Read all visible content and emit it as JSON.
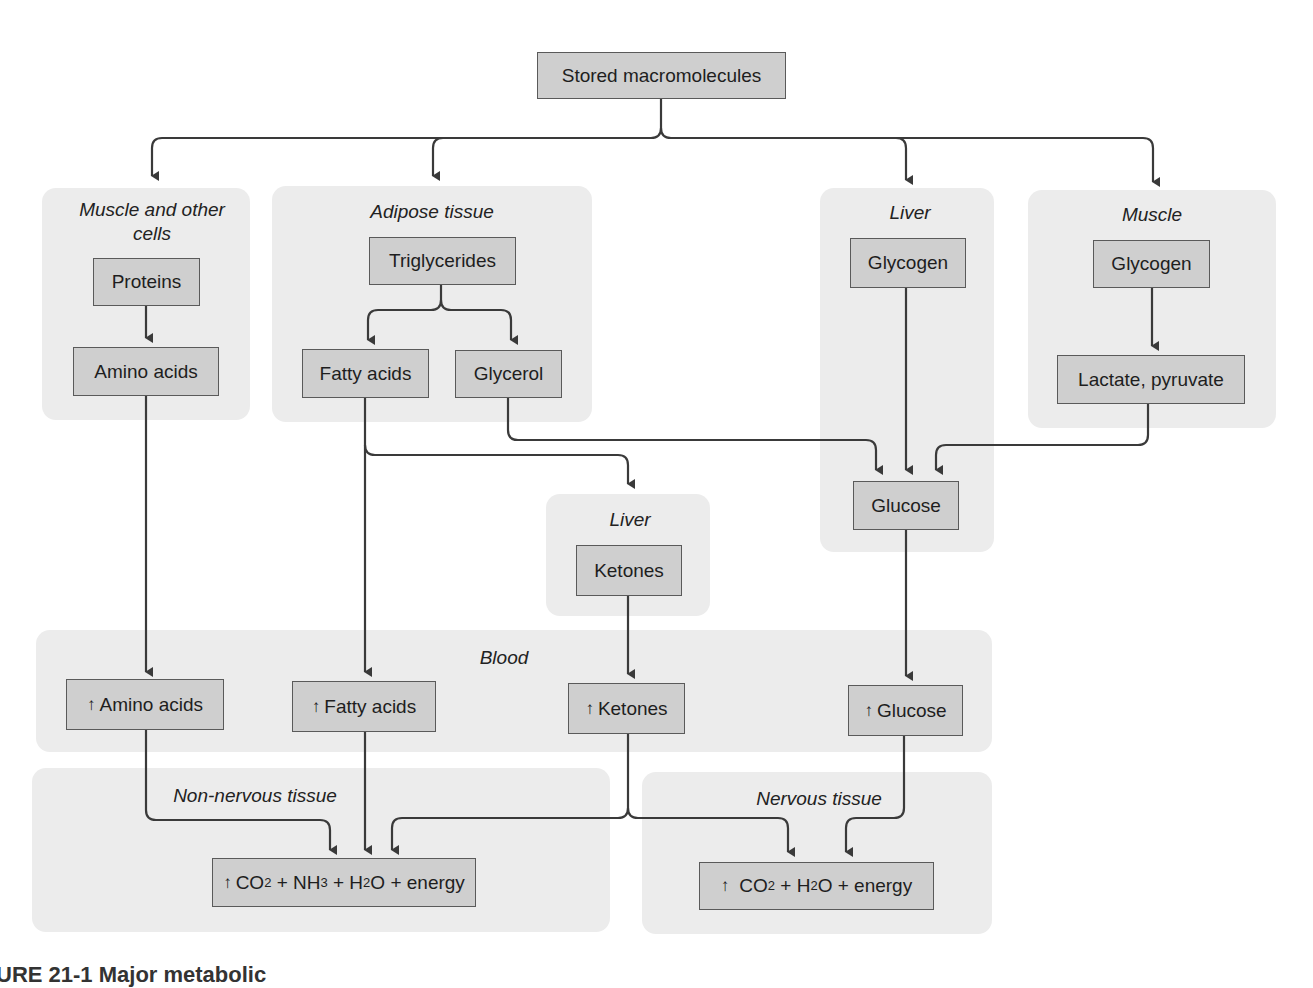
{
  "diagram": {
    "root": "Stored macromolecules",
    "regions": {
      "muscle_cells": "Muscle and other cells",
      "adipose": "Adipose tissue",
      "liver_top": "Liver",
      "muscle": "Muscle",
      "liver_mid": "Liver",
      "blood": "Blood",
      "non_nervous": "Non-nervous tissue",
      "nervous": "Nervous tissue"
    },
    "nodes": {
      "proteins": "Proteins",
      "amino_acids": "Amino acids",
      "triglycerides": "Triglycerides",
      "fatty_acids": "Fatty acids",
      "glycerol": "Glycerol",
      "liver_glycogen": "Glycogen",
      "muscle_glycogen": "Glycogen",
      "lactate_pyruvate": "Lactate, pyruvate",
      "glucose": "Glucose",
      "ketones": "Ketones",
      "blood_amino_acids": "Amino acids",
      "blood_fatty_acids": "Fatty acids",
      "blood_ketones": "Ketones",
      "blood_glucose": "Glucose"
    },
    "outputs": {
      "non_nervous": {
        "co": "CO",
        "co_sub": "2",
        "nh": " + NH",
        "nh_sub": "3",
        "h": " + H",
        "h_sub": "2",
        "rest": "O + energy"
      },
      "nervous": {
        "co": "CO",
        "co_sub": "2",
        "h": " + H",
        "h_sub": "2",
        "rest": "O + energy"
      }
    },
    "increase_symbol": "↑",
    "caption_partial": "URE 21-1 Major metabolic"
  }
}
